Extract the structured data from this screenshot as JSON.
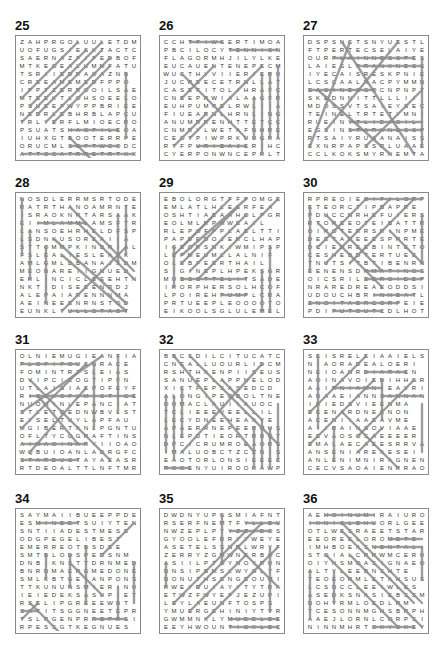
{
  "puzzles": [
    {
      "number": "25",
      "rows": [
        "ZAHPRGOLUULETDM",
        "UOFUGSIESKTACTC",
        "SAERNAZFIFEDBOF",
        "MTKEOEALUMMFATU",
        "TSRIIEDRAOAZNB",
        "CREEAMEMEDFPPO",
        "IPPTZERROOILSAE",
        "MTEEKTLOHSOEELO",
        "PSUEEFWYPPBRIEE",
        "NEDRLEBHRBLAPCU",
        "TRLYERFLMIOECRO",
        "PSUATSHAGFILEOA",
        "IUHXGTBOOTERRPE",
        "ORUCMLSOFTWOODC",
        "ATTOCATRRETRTXXD"
      ],
      "lines": [
        [
          0,
          14,
          14,
          14
        ],
        [
          6,
          11,
          12,
          11
        ],
        [
          6,
          13,
          12,
          13
        ],
        [
          13,
          4,
          13,
          12
        ],
        [
          6,
          12,
          9,
          15
        ],
        [
          0,
          7,
          7,
          0
        ],
        [
          1,
          8,
          8,
          1
        ],
        [
          0,
          10,
          10,
          0
        ],
        [
          2,
          9,
          10,
          1
        ],
        [
          3,
          10,
          11,
          2
        ],
        [
          4,
          10,
          11,
          3
        ]
      ]
    },
    {
      "number": "26",
      "rows": [
        "CCHTFIWSERTIMOA",
        "PBCILOCYTENNISN",
        "FLAGORMHJILYLKE",
        "EUCAUENTENEPECM",
        "WUCTHYVIIERIERU",
        "JUCREECETRNLLAT",
        "CASEFITOLIHRAFC",
        "CNEEPRWIALAAGFR",
        "EUHPUMPELRWLIIA",
        "FIUEARNLHRNLING",
        "ANUMRRENHTTETCK",
        "CNMRYLWETAFNHRE",
        "CEOTPIWPRKUUGRA",
        "RTFPURIBAJERIHC",
        "CYERPONWNCEPRLT"
      ],
      "lines": [
        [
          3,
          0,
          7,
          0
        ],
        [
          8,
          1,
          14,
          1
        ],
        [
          4,
          13,
          10,
          13
        ],
        [
          14,
          3,
          14,
          12
        ],
        [
          12,
          4,
          12,
          14
        ],
        [
          13,
          4,
          13,
          12
        ],
        [
          11,
          7,
          11,
          12
        ],
        [
          2,
          4,
          10,
          12
        ],
        [
          3,
          12,
          12,
          3
        ],
        [
          1,
          13,
          5,
          9
        ],
        [
          2,
          7,
          6,
          3
        ]
      ]
    },
    {
      "number": "27",
      "rows": [
        "DSPSNCTSNYUESTL",
        "FTPERTECSELAIYE",
        "OURPLAINNESSPES",
        "LAIESLFRANKNESS",
        "IYECAISRESKPNIE",
        "LCSCAALNACPYMMN",
        "EASINESSOCNPNPT",
        "SKEDNNITTLLLII",
        "MDOSSVTSAIEYSEC",
        "TEINELTRTETYMNI",
        "RUEINYTLIDIGIL",
        "EGSINSTARKNESSP",
        "RTSAIYRUAANAISS",
        "EXNRPAPSSRLUAAE",
        "CCLKOKSMYRNEMTA"
      ],
      "lines": [
        [
          3,
          2,
          13,
          2
        ],
        [
          6,
          3,
          14,
          3
        ],
        [
          0,
          6,
          8,
          6
        ],
        [
          5,
          10,
          14,
          10
        ],
        [
          5,
          11,
          14,
          11
        ],
        [
          14,
          2,
          14,
          13
        ],
        [
          5,
          0,
          0,
          13
        ],
        [
          4,
          0,
          13,
          14
        ],
        [
          11,
          0,
          2,
          11
        ],
        [
          7,
          13,
          14,
          6
        ],
        [
          1,
          6,
          10,
          14
        ]
      ]
    },
    {
      "number": "28",
      "rows": [
        "NOSDLERRMSRTODE",
        "RATRTHANOAMRNTE",
        "ISRAOKNRTARSAAK",
        "EIIMLAMMLAMSFTR",
        "LANSOEHRHELDFSP",
        "LSDNKUSOREAIIA",
        "STTOMMPKINBRIAL",
        "FSLEALTESLEAYK",
        "AMLGMLBBANAJSDM",
        "MEONAREIIGNUED",
        "ERLINCICLEEEHTN",
        "NKTIDISEEENRDJ",
        "ALEPAIARENNNMA",
        "AEINEEENRNSTOD",
        "EUNKLTULLSTAST"
      ],
      "lines": [
        [
          0,
          0,
          0,
          7
        ],
        [
          1,
          4,
          1,
          10
        ],
        [
          3,
          6,
          3,
          13
        ],
        [
          2,
          3,
          8,
          3
        ],
        [
          6,
          14,
          13,
          14
        ],
        [
          13,
          1,
          13,
          7
        ],
        [
          12,
          2,
          12,
          8
        ],
        [
          6,
          1,
          14,
          9
        ],
        [
          7,
          3,
          14,
          10
        ],
        [
          5,
          14,
          13,
          6
        ],
        [
          4,
          5,
          13,
          13
        ],
        [
          5,
          7,
          13,
          14
        ]
      ]
    },
    {
      "number": "29",
      "rows": [
        "EBOLORGTFFPOMGE",
        "EMLATLHLEERFEA",
        "OSHTIAEAAHOLPGR",
        "EOLMLRPMWEAIL",
        "RLEPOFPPLAELTTI",
        "PAPDEDOJERCLHAP",
        "IGEORSNKIWMIPSP",
        "LEPMEUMLLALNIF",
        "OLEBFEERTHAIL",
        "SIGINEPLHPEKSGR",
        "MUBSOTTELITSADE",
        "IRORPHERSOLHCOF",
        "LPOIREHPUMPLCRA",
        "PRTUEEPLEOOOOTO",
        "EIKOOLSGLULEMEL"
      ],
      "lines": [
        [
          1,
          6,
          1,
          11
        ],
        [
          12,
          9,
          12,
          14
        ],
        [
          13,
          6,
          13,
          14
        ],
        [
          2,
          10,
          10,
          10
        ],
        [
          7,
          12,
          10,
          12
        ],
        [
          2,
          7,
          10,
          0
        ],
        [
          1,
          7,
          8,
          0
        ],
        [
          2,
          8,
          9,
          1
        ],
        [
          3,
          9,
          10,
          2
        ],
        [
          4,
          10,
          14,
          0
        ],
        [
          2,
          6,
          6,
          2
        ]
      ]
    },
    {
      "number": "30",
      "rows": [
        "RPREOIEOIFILORP",
        "ETEORCTIPBAPRE",
        "PDUCCNRHEFUIERS",
        "RTOREEOTEIBATTR",
        "OIROTERRSRINPME",
        "DEETAREEESPRRTE",
        "DCIEDREEBINTETO",
        "CESHEBDTERTUEE",
        "TNUTSITBTIBENRN",
        "EENENSDRMATINGSR",
        "OICSRILEERGIDEP",
        "NRAREDREAEODDSIR",
        "UDOUCHBRINHEATL",
        "ENOITAERCORPEIE",
        "PDIPUTOUTCDLHOT"
      ],
      "lines": [
        [
          7,
          0,
          14,
          0
        ],
        [
          7,
          9,
          14,
          9
        ],
        [
          7,
          10,
          14,
          10
        ],
        [
          8,
          12,
          13,
          12
        ],
        [
          0,
          13,
          11,
          13
        ],
        [
          3,
          14,
          9,
          14
        ],
        [
          0,
          1,
          0,
          9
        ],
        [
          14,
          2,
          14,
          8
        ],
        [
          1,
          6,
          7,
          0
        ],
        [
          1,
          3,
          9,
          11
        ],
        [
          2,
          8,
          10,
          0
        ],
        [
          5,
          8,
          13,
          0
        ],
        [
          2,
          2,
          9,
          9
        ],
        [
          10,
          4,
          14,
          8
        ]
      ]
    },
    {
      "number": "31",
      "rows": [
        "OLNIEMUGIEANFIA",
        "PLOFIFOUSNRACE",
        "FOMINTRTSLEIAS",
        "DVIPCICOGTIPFN",
        "UTLAISIAEPOFEYF",
        "RICEKOFLMISTICE",
        "NUOMINLEPANCIATS",
        "STLETOEDNWBVLST",
        "EYSELTUYLAPFAU",
        "MGIBERTANLPGNTU",
        "OFLTYCOGRAFTINS",
        "AIMAGINARYIIOAO",
        "WQBUIOANLADRGFC",
        "STARDUSTAYAEASR",
        "RTDEOALTTLNFTMR"
      ],
      "lines": [
        [
          0,
          1,
          7,
          1
        ],
        [
          0,
          11,
          8,
          11
        ],
        [
          0,
          13,
          7,
          13
        ],
        [
          1,
          5,
          14,
          5
        ],
        [
          12,
          0,
          12,
          7
        ],
        [
          9,
          1,
          9,
          9
        ],
        [
          0,
          7,
          10,
          0
        ],
        [
          0,
          9,
          8,
          1
        ],
        [
          1,
          3,
          11,
          13
        ],
        [
          1,
          12,
          8,
          4
        ],
        [
          2,
          5,
          7,
          11
        ]
      ]
    },
    {
      "number": "32",
      "rows": [
        "BBCSDILCITUCATC",
        "CNEALLUOURLIDCM",
        "RSHTHAENPIISEUS",
        "SANUEPLAPPNELOD",
        "XICTPEPSASEDCD",
        "ALONGIPEOBOLTNE",
        "OUMACLAUIIAUOC",
        "TCLIEEEVEELLIL",
        "LECYDNEEHEAAYE",
        "APAERRNEPEERMUS",
        "NLEPDTIEORTRBOT",
        "DPCICRUMROEAORS",
        "IMALUOBCTZCZNIS",
        "EAOTORLONSIEEEC",
        "RGGENYUIROORAWP"
      ],
      "lines": [
        [
          0,
          5,
          0,
          12
        ],
        [
          1,
          5,
          1,
          13
        ],
        [
          2,
          4,
          2,
          10
        ],
        [
          14,
          6,
          14,
          13
        ],
        [
          12,
          8,
          12,
          14
        ],
        [
          13,
          9,
          13,
          14
        ],
        [
          11,
          9,
          11,
          14
        ],
        [
          0,
          14,
          3,
          14
        ],
        [
          1,
          0,
          11,
          12
        ],
        [
          3,
          0,
          14,
          11
        ],
        [
          12,
          1,
          2,
          12
        ],
        [
          7,
          3,
          12,
          8
        ]
      ]
    },
    {
      "number": "33",
      "rows": [
        "SEISRELEIAAIELS",
        "NIAORADEALOERI",
        "NEIOANRDIARAEN",
        "AOINAVOIEDIHHGR",
        "AAIRNIAMNIEAVRI",
        "ANAAEIANNSANNAN",
        "IEIEDSVIEENMA",
        "EEENARDNECNON",
        "ACENIIAAEAVME",
        "AIIRAINSOVIAAE",
        "EEVAOSOSAEEEER",
        "EMALAECAEESRRVA",
        "ANSENIAREAESEI",
        "ANLENIMNIRAGNEN",
        "CECVSAOAIENRRAO"
      ],
      "lines": [
        [
          1,
          0,
          1,
          9
        ],
        [
          7,
          2,
          12,
          2
        ],
        [
          3,
          4,
          9,
          4
        ],
        [
          9,
          5,
          14,
          5
        ],
        [
          9,
          3,
          9,
          8
        ],
        [
          14,
          6,
          14,
          12
        ],
        [
          0,
          7,
          7,
          0
        ],
        [
          0,
          11,
          8,
          3
        ],
        [
          4,
          7,
          11,
          14
        ],
        [
          6,
          10,
          13,
          3
        ],
        [
          3,
          9,
          3,
          13
        ],
        [
          6,
          12,
          9,
          9
        ]
      ]
    },
    {
      "number": "34",
      "rows": [
        "SAYMAIIBUEEPPDE",
        "ESMINEDTSUIYTEN",
        "SNTIIADESTMESE",
        "ODGPEGELIBEST",
        "EMERREOTBSDEE",
        "SMTBLODSPEDSNM",
        "DNBIKNSTTDRNMED",
        "BNRNMAERGMEDONE",
        "SMLKBTGEIANPONS",
        "TTKUNUNSMIERINU",
        "IEIEDEKSASUPIET",
        "RSELIPGREEEWBT",
        "SATITSGGNEETEPR",
        "TSLPGENPRRBPRSI",
        "RPESSGTKEGNUES"
      ],
      "lines": [
        [
          2,
          1,
          7,
          1
        ],
        [
          9,
          13,
          13,
          13
        ],
        [
          0,
          12,
          2,
          12
        ],
        [
          3,
          5,
          3,
          8
        ],
        [
          6,
          5,
          6,
          9
        ],
        [
          8,
          4,
          8,
          11
        ],
        [
          14,
          6,
          14,
          11
        ],
        [
          12,
          9,
          12,
          13
        ],
        [
          1,
          11,
          5,
          15
        ],
        [
          0,
          13,
          2,
          11
        ],
        [
          10,
          5,
          14,
          1
        ],
        [
          6,
          6,
          10,
          10
        ]
      ]
    },
    {
      "number": "35",
      "rows": [
        "DWDNYUPGSMIAFNT",
        "RSERFNEMTFYLLEU",
        "NWZEPLPYYZZIDOS",
        "GYOOLEFRRYYWEYE",
        "ASETELSSNRLWRYF",
        "ZERRYZGMWNERBOC",
        "ASIILPTOYNOYRUN",
        "NNSIPBMSLWYGLYF",
        "NONUTHSENGEOUMI",
        "RWEYDUIAYYTYTRAE",
        "ETWZFWYEFJEZUPI",
        "LEYLAEUNFTOSPS",
        "YMUERGEHINIYTVR",
        "GWMMNKLYMUDDLEE",
        "EEYHWOUNTICKLEC"
      ],
      "lines": [
        [
          7,
          0,
          7,
          6
        ],
        [
          0,
          6,
          0,
          9
        ],
        [
          10,
          1,
          14,
          1
        ],
        [
          8,
          2,
          13,
          2
        ],
        [
          8,
          13,
          14,
          13
        ],
        [
          8,
          14,
          14,
          14
        ],
        [
          13,
          4,
          13,
          12
        ],
        [
          5,
          13,
          14,
          4
        ],
        [
          3,
          12,
          10,
          5
        ],
        [
          1,
          11,
          10,
          2
        ],
        [
          4,
          9,
          12,
          1
        ],
        [
          9,
          4,
          14,
          9
        ]
      ]
    },
    {
      "number": "36",
      "rows": [
        "AEHOINUMIRAIURO",
        "IKNISLEHUORLGEE",
        "OTLWESRAEETSTAR",
        "EEOREELOROMETE",
        "IMHBOEASNENTAL",
        "STOIALCRRWMCERU",
        "OIYNSMOASIGNAEO",
        "ALTYLEEBNSHTE",
        "TEOEORMLETAHSUS",
        "LCSNCCLEEIWLES",
        "ASEDKSNASIEBSSM",
        "NOHYRMLOEDLRM",
        "TCESONNMGHSBRPH",
        "AAEJLORNLCORPSI",
        "NINNMHRTOKYOKEY"
      ],
      "lines": [
        [
          2,
          0,
          8,
          0
        ],
        [
          0,
          1,
          8,
          1
        ],
        [
          10,
          3,
          14,
          3
        ],
        [
          8,
          4,
          14,
          4
        ],
        [
          8,
          14,
          13,
          14
        ],
        [
          14,
          4,
          14,
          8
        ],
        [
          0,
          7,
          0,
          13
        ],
        [
          3,
          7,
          3,
          11
        ],
        [
          4,
          1,
          14,
          11
        ],
        [
          5,
          5,
          14,
          14
        ],
        [
          4,
          2,
          13,
          11
        ],
        [
          2,
          5,
          11,
          14
        ]
      ]
    }
  ]
}
